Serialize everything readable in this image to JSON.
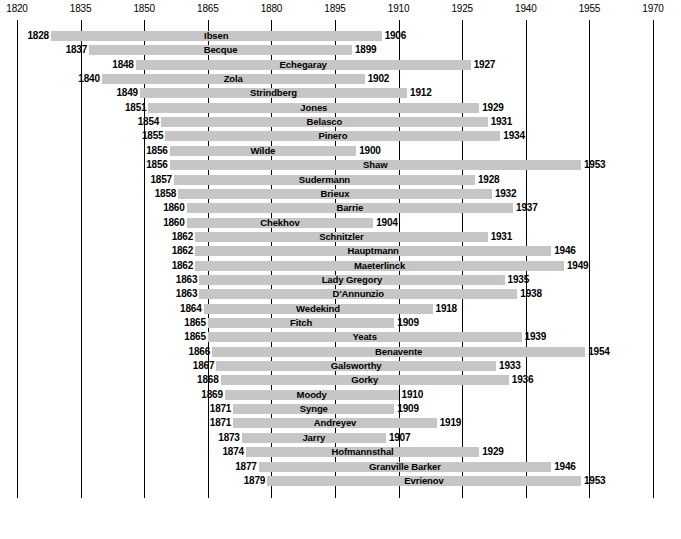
{
  "chart_data": {
    "type": "bar",
    "orientation": "horizontal-timeline",
    "title": "",
    "subtitle": "",
    "xlabel": "",
    "ylabel": "",
    "xlim": [
      1820,
      1970
    ],
    "tick_step": 15,
    "tick_labels": [
      "1820",
      "1835",
      "1850",
      "1865",
      "1880",
      "1895",
      "1910",
      "1925",
      "1940",
      "1955",
      "1970"
    ],
    "grid": true,
    "legend": null,
    "bar_color": "#c6c6c6",
    "axis_color": "#000000",
    "categories": [
      "Ibsen",
      "Becque",
      "Echegaray",
      "Zola",
      "Strindberg",
      "Jones",
      "Belasco",
      "Pinero",
      "Wilde",
      "Shaw",
      "Sudermann",
      "Brieux",
      "Barrie",
      "Chekhov",
      "Schnitzler",
      "Hauptmann",
      "Maeterlinck",
      "Lady Gregory",
      "D'Annunzio",
      "Wedekind",
      "Fitch",
      "Yeats",
      "Benavente",
      "Galsworthy",
      "Gorky",
      "Moody",
      "Synge",
      "Andreyev",
      "Jarry",
      "Hofmannsthal",
      "Granville Barker",
      "Evrienov"
    ],
    "rows": [
      {
        "name": "Ibsen",
        "start": 1828,
        "end": 1906,
        "start_label": "1828",
        "end_label": "1906"
      },
      {
        "name": "Becque",
        "start": 1837,
        "end": 1899,
        "start_label": "1837",
        "end_label": "1899"
      },
      {
        "name": "Echegaray",
        "start": 1848,
        "end": 1927,
        "start_label": "1848",
        "end_label": "1927"
      },
      {
        "name": "Zola",
        "start": 1840,
        "end": 1902,
        "start_label": "1840",
        "end_label": "1902"
      },
      {
        "name": "Strindberg",
        "start": 1849,
        "end": 1912,
        "start_label": "1849",
        "end_label": "1912"
      },
      {
        "name": "Jones",
        "start": 1851,
        "end": 1929,
        "start_label": "1851",
        "end_label": "1929"
      },
      {
        "name": "Belasco",
        "start": 1854,
        "end": 1931,
        "start_label": "1854",
        "end_label": "1931"
      },
      {
        "name": "Pinero",
        "start": 1855,
        "end": 1934,
        "start_label": "1855",
        "end_label": "1934"
      },
      {
        "name": "Wilde",
        "start": 1856,
        "end": 1900,
        "start_label": "1856",
        "end_label": "1900"
      },
      {
        "name": "Shaw",
        "start": 1856,
        "end": 1953,
        "start_label": "1856",
        "end_label": "1953"
      },
      {
        "name": "Sudermann",
        "start": 1857,
        "end": 1928,
        "start_label": "1857",
        "end_label": "1928"
      },
      {
        "name": "Brieux",
        "start": 1858,
        "end": 1932,
        "start_label": "1858",
        "end_label": "1932"
      },
      {
        "name": "Barrie",
        "start": 1860,
        "end": 1937,
        "start_label": "1860",
        "end_label": "1937"
      },
      {
        "name": "Chekhov",
        "start": 1860,
        "end": 1904,
        "start_label": "1860",
        "end_label": "1904"
      },
      {
        "name": "Schnitzler",
        "start": 1862,
        "end": 1931,
        "start_label": "1862",
        "end_label": "1931"
      },
      {
        "name": "Hauptmann",
        "start": 1862,
        "end": 1946,
        "start_label": "1862",
        "end_label": "1946"
      },
      {
        "name": "Maeterlinck",
        "start": 1862,
        "end": 1949,
        "start_label": "1862",
        "end_label": "1949"
      },
      {
        "name": "Lady Gregory",
        "start": 1863,
        "end": 1935,
        "start_label": "1863",
        "end_label": "1935"
      },
      {
        "name": "D'Annunzio",
        "start": 1863,
        "end": 1938,
        "start_label": "1863",
        "end_label": "1938"
      },
      {
        "name": "Wedekind",
        "start": 1864,
        "end": 1918,
        "start_label": "1864",
        "end_label": "1918"
      },
      {
        "name": "Fitch",
        "start": 1865,
        "end": 1909,
        "start_label": "1865",
        "end_label": "1909"
      },
      {
        "name": "Yeats",
        "start": 1865,
        "end": 1939,
        "start_label": "1865",
        "end_label": "1939"
      },
      {
        "name": "Benavente",
        "start": 1866,
        "end": 1954,
        "start_label": "1866",
        "end_label": "1954"
      },
      {
        "name": "Galsworthy",
        "start": 1867,
        "end": 1933,
        "start_label": "1867",
        "end_label": "1933"
      },
      {
        "name": "Gorky",
        "start": 1868,
        "end": 1936,
        "start_label": "1868",
        "end_label": "1936"
      },
      {
        "name": "Moody",
        "start": 1869,
        "end": 1910,
        "start_label": "1869",
        "end_label": "1910"
      },
      {
        "name": "Synge",
        "start": 1871,
        "end": 1909,
        "start_label": "1871",
        "end_label": "1909"
      },
      {
        "name": "Andreyev",
        "start": 1871,
        "end": 1919,
        "start_label": "1871",
        "end_label": "1919"
      },
      {
        "name": "Jarry",
        "start": 1873,
        "end": 1907,
        "start_label": "1873",
        "end_label": "1907"
      },
      {
        "name": "Hofmannsthal",
        "start": 1874,
        "end": 1929,
        "start_label": "1874",
        "end_label": "1929"
      },
      {
        "name": "Granville Barker",
        "start": 1877,
        "end": 1946,
        "start_label": "1877",
        "end_label": "1946"
      },
      {
        "name": "Evrienov",
        "start": 1879,
        "end": 1953,
        "start_label": "1879",
        "end_label": "1953"
      }
    ]
  },
  "layout": {
    "x_1820_px": 17,
    "x_1970_px": 653,
    "px_per_year": 4.24,
    "row_top_px": 31,
    "row_pitch_px": 14.35,
    "bar_height_px": 10
  }
}
